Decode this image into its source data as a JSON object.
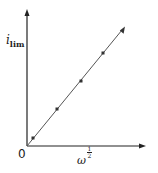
{
  "chart_data": {
    "type": "line",
    "title": "",
    "xlabel": "ω^(1/2)",
    "ylabel": "i_lim",
    "origin_label": "0",
    "grid": false,
    "legend": null,
    "x": [
      0.05,
      0.25,
      0.45,
      0.65
    ],
    "series": [
      {
        "name": "i_lim vs ω^(1/2)",
        "marker_points": [
          0.065,
          0.27,
          0.47,
          0.67
        ],
        "values": [
          0.065,
          0.27,
          0.47,
          0.67
        ],
        "fit": "linear through origin"
      }
    ],
    "xlim": [
      0,
      1
    ],
    "ylim": [
      0,
      1
    ]
  },
  "labels": {
    "y_main": "i",
    "y_sub": "lim",
    "x_main": "ω",
    "x_exp_num": "1",
    "x_exp_den": "2",
    "origin": "0"
  },
  "colors": {
    "axis": "#222222",
    "line": "#555555",
    "marker": "#333333"
  }
}
